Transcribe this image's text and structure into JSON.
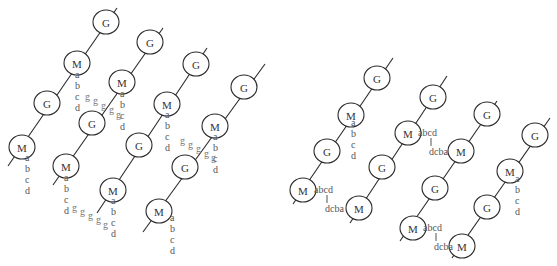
{
  "node_labels": {
    "gene": "G",
    "marker": "M"
  },
  "chromatid_labels": {
    "abcd_vertical": [
      "a",
      "b",
      "c",
      "d"
    ],
    "abcd_horizontal": "abcd",
    "dcba": "dcba",
    "g": "g"
  },
  "left_panel": {
    "strands": [
      {
        "line": [
          8,
          166,
          117,
          8
        ],
        "nodes": [
          {
            "type": "G",
            "x": 106,
            "y": 22
          },
          {
            "type": "M",
            "x": 77,
            "y": 63
          },
          {
            "type": "G",
            "x": 47,
            "y": 103
          },
          {
            "type": "M",
            "x": 22,
            "y": 147
          }
        ]
      },
      {
        "line": [
          53,
          185,
          163,
          28
        ],
        "nodes": [
          {
            "type": "G",
            "x": 150,
            "y": 42
          },
          {
            "type": "M",
            "x": 122,
            "y": 82
          },
          {
            "type": "G",
            "x": 92,
            "y": 123
          },
          {
            "type": "M",
            "x": 66,
            "y": 166
          }
        ]
      },
      {
        "line": [
          97,
          213,
          207,
          48
        ],
        "nodes": [
          {
            "type": "G",
            "x": 196,
            "y": 64
          },
          {
            "type": "M",
            "x": 167,
            "y": 104
          },
          {
            "type": "G",
            "x": 139,
            "y": 145
          },
          {
            "type": "M",
            "x": 113,
            "y": 190
          }
        ]
      },
      {
        "line": [
          143,
          232,
          265,
          64
        ],
        "nodes": [
          {
            "type": "G",
            "x": 244,
            "y": 87
          },
          {
            "type": "M",
            "x": 215,
            "y": 126
          },
          {
            "type": "G",
            "x": 185,
            "y": 167
          },
          {
            "type": "M",
            "x": 159,
            "y": 211
          }
        ]
      }
    ],
    "abcd_columns": [
      {
        "x": 75,
        "y": 78
      },
      {
        "x": 120,
        "y": 97
      },
      {
        "x": 25,
        "y": 161
      },
      {
        "x": 165,
        "y": 118
      },
      {
        "x": 64,
        "y": 181
      },
      {
        "x": 213,
        "y": 140
      },
      {
        "x": 111,
        "y": 204
      },
      {
        "x": 170,
        "y": 221
      }
    ],
    "g_chains": [
      [
        {
          "x": 85,
          "y": 100
        },
        {
          "x": 93,
          "y": 104
        },
        {
          "x": 101,
          "y": 109
        },
        {
          "x": 109,
          "y": 113
        },
        {
          "x": 116,
          "y": 118
        }
      ],
      [
        {
          "x": 180,
          "y": 144
        },
        {
          "x": 188,
          "y": 148
        },
        {
          "x": 196,
          "y": 152
        },
        {
          "x": 204,
          "y": 157
        },
        {
          "x": 211,
          "y": 161
        }
      ],
      [
        {
          "x": 72,
          "y": 211
        },
        {
          "x": 80,
          "y": 215
        },
        {
          "x": 88,
          "y": 219
        },
        {
          "x": 96,
          "y": 223
        },
        {
          "x": 103,
          "y": 228
        }
      ]
    ]
  },
  "right_panel": {
    "strands": [
      {
        "line": [
          293,
          204,
          393,
          58
        ],
        "nodes": [
          {
            "type": "G",
            "x": 377,
            "y": 78
          },
          {
            "type": "M",
            "x": 351,
            "y": 115
          },
          {
            "type": "G",
            "x": 327,
            "y": 151
          },
          {
            "type": "M",
            "x": 303,
            "y": 190
          }
        ]
      },
      {
        "line": [
          350,
          223,
          447,
          76
        ],
        "nodes": [
          {
            "type": "G",
            "x": 433,
            "y": 97
          },
          {
            "type": "M",
            "x": 408,
            "y": 133
          },
          {
            "type": "G",
            "x": 382,
            "y": 167
          },
          {
            "type": "M",
            "x": 359,
            "y": 208
          }
        ]
      },
      {
        "line": [
          400,
          241,
          497,
          101
        ],
        "nodes": [
          {
            "type": "G",
            "x": 487,
            "y": 114
          },
          {
            "type": "M",
            "x": 461,
            "y": 151
          },
          {
            "type": "G",
            "x": 435,
            "y": 188
          },
          {
            "type": "M",
            "x": 413,
            "y": 228
          }
        ]
      },
      {
        "line": [
          452,
          258,
          550,
          118
        ],
        "nodes": [
          {
            "type": "G",
            "x": 535,
            "y": 135
          },
          {
            "type": "M",
            "x": 510,
            "y": 171
          },
          {
            "type": "G",
            "x": 487,
            "y": 207
          },
          {
            "type": "M",
            "x": 462,
            "y": 246
          }
        ]
      }
    ],
    "abcd_columns": [
      {
        "x": 351,
        "y": 126
      },
      {
        "x": 515,
        "y": 182
      }
    ],
    "inversions": [
      {
        "abcd_x": 314,
        "abcd_y": 190,
        "tick_x": 327,
        "tick_y1": 195,
        "tick_y2": 203,
        "dcba_x": 325,
        "dcba_y": 209
      },
      {
        "abcd_x": 418,
        "abcd_y": 133,
        "tick_x": 431,
        "tick_y1": 138,
        "tick_y2": 146,
        "dcba_x": 429,
        "dcba_y": 152
      },
      {
        "abcd_x": 423,
        "abcd_y": 228,
        "tick_x": 436,
        "tick_y1": 233,
        "tick_y2": 241,
        "dcba_x": 434,
        "dcba_y": 247
      }
    ]
  }
}
